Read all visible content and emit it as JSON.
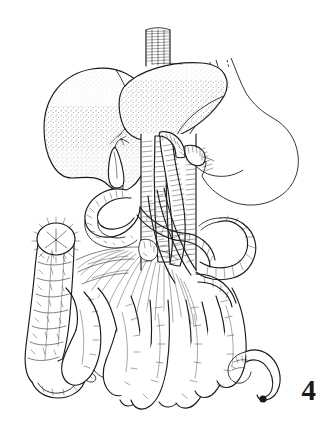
{
  "figure": {
    "number": "4",
    "caption_visible": false,
    "background_color": "#ffffff",
    "ink_color": "#1a1a1a",
    "style": "pen-and-ink stipple line drawing",
    "width": 323,
    "height": 429
  },
  "illustration": {
    "title": "Abdominal viscera",
    "subject": "human abdominal organs with mesenteric vasculature",
    "technique": "stippled and hatched line art",
    "parts": [
      {
        "id": "esophagus",
        "label": "Esophagus"
      },
      {
        "id": "liver-right-lobe",
        "label": "Right lobe of liver"
      },
      {
        "id": "liver-left-lobe",
        "label": "Left lobe of liver"
      },
      {
        "id": "gallbladder",
        "label": "Gallbladder"
      },
      {
        "id": "stomach",
        "label": "Stomach (outline)"
      },
      {
        "id": "aorta",
        "label": "Abdominal aorta"
      },
      {
        "id": "inferior-vena-cava",
        "label": "Inferior vena cava"
      },
      {
        "id": "mesenteric-vessels",
        "label": "Mesenteric vessels"
      },
      {
        "id": "duodenum",
        "label": "Duodenum"
      },
      {
        "id": "transverse-colon",
        "label": "Transverse colon"
      },
      {
        "id": "ascending-colon",
        "label": "Ascending colon"
      },
      {
        "id": "descending-colon",
        "label": "Descending colon"
      },
      {
        "id": "small-intestine",
        "label": "Small intestine loops"
      },
      {
        "id": "mesentery",
        "label": "Mesentery"
      },
      {
        "id": "appendix",
        "label": "Appendix"
      },
      {
        "id": "cut-end",
        "label": "Sutured cut end of colon"
      }
    ]
  }
}
